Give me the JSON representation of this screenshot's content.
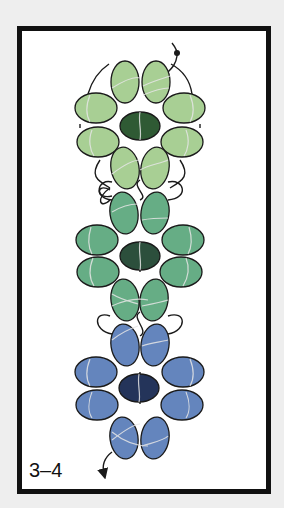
{
  "figure": {
    "label": "3–4",
    "background_color": "#eeeeee",
    "frame_color": "#111111"
  },
  "diagram": {
    "type": "beadwork-pattern",
    "thread_color": "#1a1a1a",
    "thread_highlight_color": "#e6e6e6",
    "flowers": [
      {
        "name": "top-flower",
        "petal_color": "#a8cf94",
        "center_color": "#2f5a34"
      },
      {
        "name": "middle-flower",
        "petal_color": "#66ad85",
        "center_color": "#2c4f3c"
      },
      {
        "name": "bottom-flower",
        "petal_color": "#6485bd",
        "center_color": "#24345a"
      }
    ],
    "thread_start": "arrow-in-top-right",
    "thread_end": "arrow-out-bottom-left"
  }
}
